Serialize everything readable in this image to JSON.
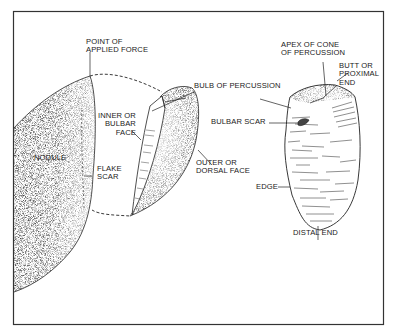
{
  "figure": {
    "type": "flake-anatomy-illustration",
    "frame_color": "#333333",
    "ink_color": "#1a1a1a"
  },
  "labels": {
    "point_of_applied_force": "POINT OF\nAPPLIED FORCE",
    "nodule": "NODULE",
    "inner_bulbar_face": "INNER OR\nBULBAR\nFACE",
    "flake_scar": "FLAKE\nSCAR",
    "bulb_of_percussion": "BULB OF PERCUSSION",
    "outer_dorsal_face": "OUTER OR\nDORSAL FACE",
    "apex_of_cone": "APEX OF CONE\nOF PERCUSSION",
    "butt_proximal_end": "BUTT OR\nPROXIMAL\nEND",
    "bulbar_scar": "BULBAR SCAR",
    "edge": "EDGE",
    "distal_end": "DISTAL END"
  }
}
